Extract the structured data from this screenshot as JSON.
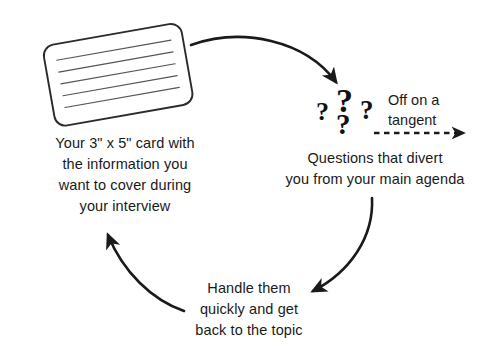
{
  "diagram": {
    "background_color": "#ffffff",
    "ink_color": "#1a1a1a",
    "captions": {
      "card": "Your 3\" x 5\" card with\nthe information you\nwant to cover during\nyour interview",
      "questions": "Questions that divert\nyou from your main agenda",
      "handle": "Handle them\nquickly and get\nback to the topic"
    },
    "labels": {
      "tangent": "Off on a\ntangent"
    },
    "question_marks": {
      "big": "?",
      "left": "?",
      "right": "?",
      "bottom": "?"
    },
    "card": {
      "ruled_line_count": 5,
      "rotation_degrees": -10
    },
    "arrows": [
      {
        "name": "card-to-questions",
        "style": "solid-curved",
        "direction": "left-to-right-down"
      },
      {
        "name": "questions-to-handle",
        "style": "solid-curved",
        "direction": "right-down-to-left"
      },
      {
        "name": "handle-to-card",
        "style": "solid-curved",
        "direction": "right-to-up-left"
      },
      {
        "name": "off-on-tangent",
        "style": "dashed-straight",
        "direction": "left-to-right"
      }
    ]
  }
}
